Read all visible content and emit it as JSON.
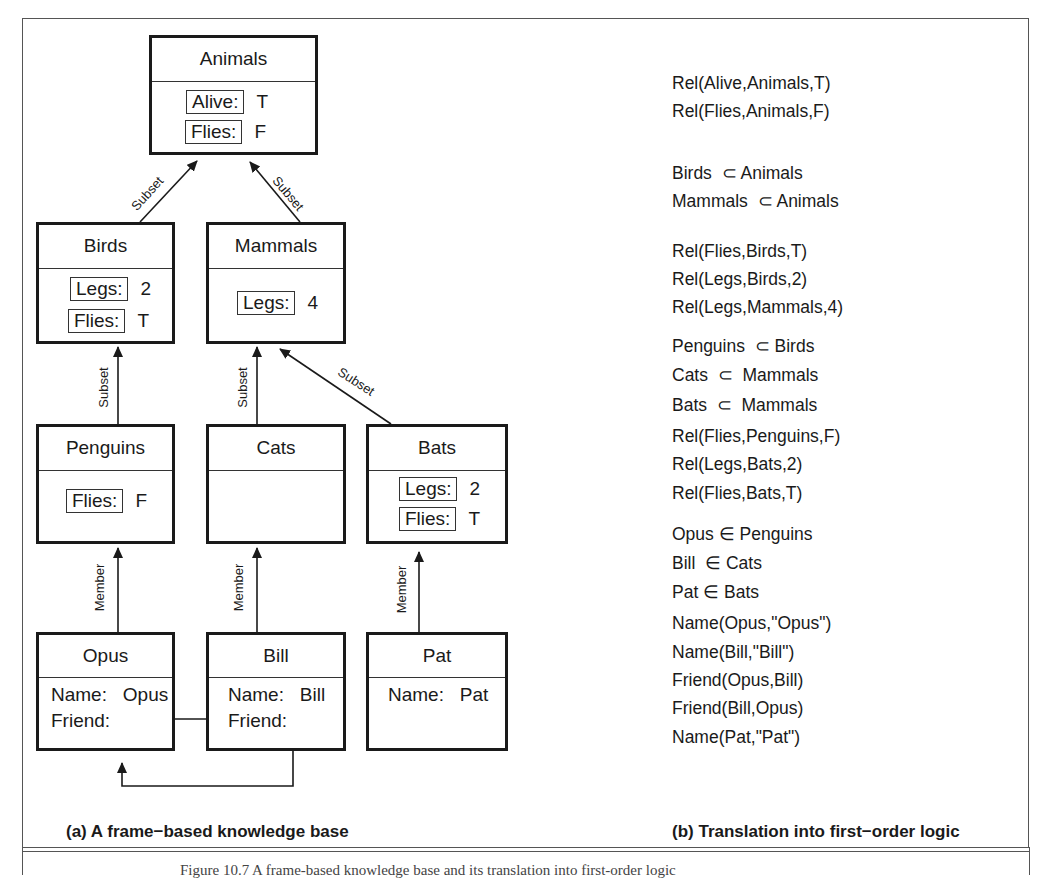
{
  "diagram": {
    "frames": {
      "animals": {
        "title": "Animals",
        "slots": [
          {
            "key": "Alive:",
            "value": "T"
          },
          {
            "key": "Flies:",
            "value": "F"
          }
        ]
      },
      "birds": {
        "title": "Birds",
        "slots": [
          {
            "key": "Legs:",
            "value": "2"
          },
          {
            "key": "Flies:",
            "value": "T"
          }
        ]
      },
      "mammals": {
        "title": "Mammals",
        "slots": [
          {
            "key": "Legs:",
            "value": "4"
          }
        ]
      },
      "penguins": {
        "title": "Penguins",
        "slots": [
          {
            "key": "Flies:",
            "value": "F"
          }
        ]
      },
      "cats": {
        "title": "Cats",
        "slots": []
      },
      "bats": {
        "title": "Bats",
        "slots": [
          {
            "key": "Legs:",
            "value": "2"
          },
          {
            "key": "Flies:",
            "value": "T"
          }
        ]
      },
      "opus": {
        "title": "Opus",
        "fields": [
          {
            "key": "Name:",
            "value": "Opus"
          },
          {
            "key": "Friend:",
            "value": ""
          }
        ]
      },
      "bill": {
        "title": "Bill",
        "fields": [
          {
            "key": "Name:",
            "value": "Bill"
          },
          {
            "key": "Friend:",
            "value": ""
          }
        ]
      },
      "pat": {
        "title": "Pat",
        "fields": [
          {
            "key": "Name:",
            "value": "Pat"
          }
        ]
      }
    },
    "edges": {
      "subset": "Subset",
      "member": "Member"
    },
    "caption_a": "(a) A frame−based knowledge base"
  },
  "logic": {
    "lines": [
      "Rel(Alive,Animals,T)",
      "Rel(Flies,Animals,F)",
      "Birds  ⊂ Animals",
      "Mammals  ⊂ Animals",
      "Rel(Flies,Birds,T)",
      "Rel(Legs,Birds,2)",
      "Rel(Legs,Mammals,4)",
      "Penguins  ⊂ Birds",
      "Cats  ⊂  Mammals",
      "Bats  ⊂  Mammals",
      "Rel(Flies,Penguins,F)",
      "Rel(Legs,Bats,2)",
      "Rel(Flies,Bats,T)",
      "Opus ∈ Penguins",
      "Bill  ∈ Cats",
      "Pat ∈ Bats",
      "Name(Opus,\"Opus\")",
      "Name(Bill,\"Bill\")",
      "Friend(Opus,Bill)",
      "Friend(Bill,Opus)",
      "Name(Pat,\"Pat\")"
    ],
    "caption_b": "(b) Translation into first−order logic"
  },
  "figure_caption": "Figure 10.7   A frame-based knowledge base and its translation into first-order logic"
}
